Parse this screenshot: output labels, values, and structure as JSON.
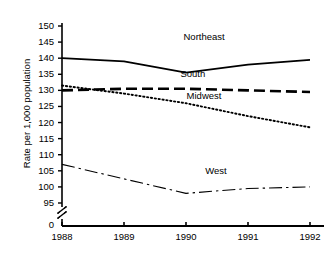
{
  "chart_data": {
    "type": "line",
    "title": "",
    "xlabel": "",
    "ylabel": "Rate per 1,000 population",
    "categories": [
      "1988",
      "1989",
      "1990",
      "1991",
      "1992"
    ],
    "x": [
      1988,
      1989,
      1990,
      1991,
      1992
    ],
    "ylim": [
      95,
      150
    ],
    "yticks": [
      95,
      100,
      105,
      110,
      115,
      120,
      125,
      130,
      135,
      140,
      145,
      150
    ],
    "ytick_labels": [
      "95",
      "100",
      "105",
      "110",
      "115",
      "120",
      "125",
      "130",
      "135",
      "140",
      "145",
      "150"
    ],
    "axis_break": true,
    "axis_origin_label": "0",
    "grid": false,
    "legend_position": "inline-labels",
    "series": [
      {
        "name": "Northeast",
        "style": "solid",
        "color": "#000000",
        "values": [
          140,
          139,
          135.5,
          138,
          139.5
        ],
        "label_x": 1990.25,
        "label_y": 146.5
      },
      {
        "name": "South",
        "style": "dashed",
        "color": "#000000",
        "values": [
          130,
          130.5,
          130.5,
          130,
          129.5
        ],
        "label_x": 1990.2,
        "label_y": 135.0
      },
      {
        "name": "Midwest",
        "style": "dotted",
        "color": "#000000",
        "values": [
          131.5,
          129,
          126,
          122,
          118.5
        ],
        "label_x": 1990.3,
        "label_y": 128.2
      },
      {
        "name": "West",
        "style": "dashdot",
        "color": "#000000",
        "values": [
          107,
          102.5,
          98,
          99.5,
          100
        ],
        "label_x": 1990.6,
        "label_y": 105.0
      }
    ]
  },
  "ylabel_text": "Rate per 1,000 population",
  "zero_label": "0",
  "ticks": {
    "y": [
      "150",
      "145",
      "140",
      "135",
      "130",
      "125",
      "120",
      "115",
      "110",
      "105",
      "100",
      "95"
    ],
    "x": [
      "1988",
      "1989",
      "1990",
      "1991",
      "1992"
    ]
  },
  "series_labels": {
    "northeast": "Northeast",
    "south": "South",
    "midwest": "Midwest",
    "west": "West"
  }
}
